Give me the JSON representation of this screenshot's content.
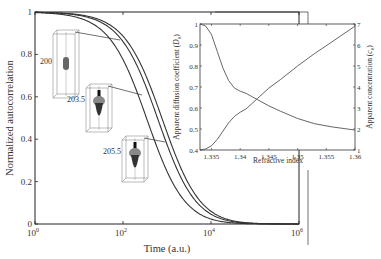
{
  "chart_data": [
    {
      "type": "line",
      "name": "main",
      "title": "",
      "xlabel": "Time (a.u.)",
      "ylabel": "Normalized autocorrelation",
      "xscale": "log",
      "xlim": [
        1,
        1000000
      ],
      "ylim": [
        0,
        1
      ],
      "xticks": [
        {
          "v": 0,
          "label": "10",
          "exp": "0"
        },
        {
          "v": 2,
          "label": "10",
          "exp": "2"
        },
        {
          "v": 4,
          "label": "10",
          "exp": "4"
        },
        {
          "v": 6,
          "label": "10",
          "exp": "6"
        }
      ],
      "yticks": [
        {
          "v": 0,
          "label": "0"
        },
        {
          "v": 0.2,
          "label": "0.2"
        },
        {
          "v": 0.4,
          "label": "0.4"
        },
        {
          "v": 0.6,
          "label": "0.6"
        },
        {
          "v": 0.8,
          "label": "0.8"
        },
        {
          "v": 1,
          "label": "1"
        }
      ],
      "grid": false,
      "series": [
        {
          "name": "200",
          "log10_tau": 2.55
        },
        {
          "name": "203.5",
          "log10_tau": 2.8
        },
        {
          "name": "205.5",
          "log10_tau": 2.9
        }
      ],
      "annotations": [
        {
          "label": "200",
          "type": "molecule-box"
        },
        {
          "label": "203.5",
          "type": "molecule-box"
        },
        {
          "label": "205.5",
          "type": "molecule-box"
        }
      ]
    },
    {
      "type": "line",
      "name": "inset",
      "xlabel": "Refractive index",
      "ylabel_left": "Apparent diffusion coefficient (D0)",
      "ylabel_right": "Apparent concentration (c0)",
      "xlim": [
        1.333,
        1.36
      ],
      "ylim_left": [
        0.4,
        1
      ],
      "ylim_right": [
        1,
        7
      ],
      "xticks": [
        "1.335",
        "1.34",
        "1.345",
        "1.35",
        "1.355",
        "1.36"
      ],
      "yticks_left": [
        "0.4",
        "0.5",
        "0.6",
        "0.7",
        "0.8",
        "0.9",
        "1"
      ],
      "yticks_right": [
        "1",
        "2",
        "3",
        "4",
        "5",
        "6",
        "7"
      ],
      "series": [
        {
          "name": "Apparent diffusion coefficient",
          "axis": "left",
          "x": [
            1.333,
            1.334,
            1.335,
            1.336,
            1.337,
            1.338,
            1.339,
            1.34,
            1.341,
            1.342,
            1.343,
            1.345,
            1.347,
            1.35,
            1.353,
            1.356,
            1.36
          ],
          "y": [
            1.0,
            0.99,
            0.95,
            0.87,
            0.79,
            0.73,
            0.695,
            0.68,
            0.67,
            0.655,
            0.64,
            0.61,
            0.585,
            0.55,
            0.525,
            0.51,
            0.495
          ]
        },
        {
          "name": "Apparent concentration",
          "axis": "right",
          "x": [
            1.333,
            1.334,
            1.335,
            1.336,
            1.337,
            1.338,
            1.339,
            1.34,
            1.341,
            1.342,
            1.343,
            1.345,
            1.347,
            1.35,
            1.353,
            1.356,
            1.36
          ],
          "y": [
            1.0,
            1.05,
            1.2,
            1.5,
            1.9,
            2.3,
            2.6,
            2.8,
            2.95,
            3.2,
            3.45,
            3.95,
            4.35,
            5.0,
            5.6,
            6.15,
            6.9
          ]
        }
      ]
    }
  ],
  "labels": {
    "main_xlabel": "Time (a.u.)",
    "main_ylabel": "Normalized autocorrelation",
    "inset_xlabel": "Refractive index",
    "inset_ylabel_left": "Apparent diffusion coefficient (",
    "inset_ylabel_left_sym": "D",
    "inset_ylabel_left_sub": "0",
    "inset_ylabel_right": "Apparent concentration (",
    "inset_ylabel_right_sym": "c",
    "inset_ylabel_right_sub": "0",
    "close_paren": ")"
  }
}
